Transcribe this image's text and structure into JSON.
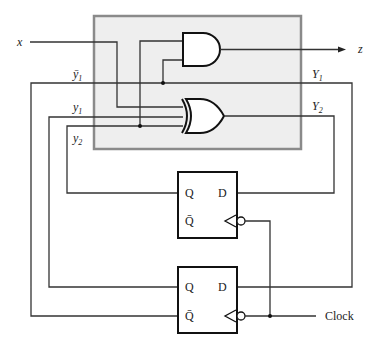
{
  "diagram": {
    "type": "sequential-circuit",
    "combinational_block": {
      "fill": "#eeeeee",
      "border": "#8a8a8a"
    },
    "inputs": {
      "x": "x",
      "clock": "Clock"
    },
    "outputs": {
      "z": "z"
    },
    "labels": {
      "y1_bar": "ȳ",
      "y1_bar_sub": "1",
      "y1": "y",
      "y1_sub": "1",
      "y2": "y",
      "y2_sub": "2",
      "Y1": "Y",
      "Y1_sub": "1",
      "Y2": "Y",
      "Y2_sub": "2"
    },
    "gates": [
      {
        "id": "and",
        "kind": "AND",
        "inputs": [
          "y2",
          "y1_bar"
        ],
        "output": "z"
      },
      {
        "id": "xor",
        "kind": "XOR",
        "inputs": [
          "x",
          "y1",
          "y2"
        ],
        "output": "Y2"
      }
    ],
    "flip_flops": [
      {
        "id": "ff-top",
        "pin_q": "Q",
        "pin_qbar": "Q̄",
        "pin_d": "D",
        "d_input": "Y2",
        "q_output": "y2"
      },
      {
        "id": "ff-bottom",
        "pin_q": "Q",
        "pin_qbar": "Q̄",
        "pin_d": "D",
        "d_input": "Y1",
        "q_output": "y1",
        "qbar_output": "ȳ1"
      }
    ]
  }
}
